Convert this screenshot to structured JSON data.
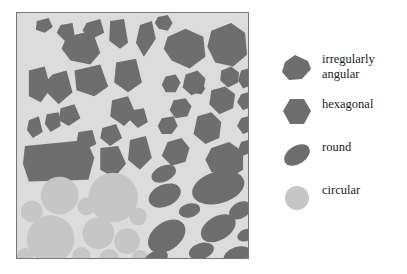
{
  "figure": {
    "panel": {
      "name": "shape-classification-panel",
      "background_color": "#dcdcdc",
      "border_color": "#777777",
      "quadrants": [
        {
          "id": "top-left",
          "class": "irregularly angular",
          "fill": "#6e6e6e",
          "separator": "#ffffff"
        },
        {
          "id": "top-right",
          "class": "hexagonal",
          "fill": "#6e6e6e",
          "separator": "#dcdcdc"
        },
        {
          "id": "bottom-left",
          "class": "circular",
          "fill": "#c6c6c6",
          "separator": "#dcdcdc"
        },
        {
          "id": "bottom-right",
          "class": "round",
          "fill": "#6e6e6e",
          "separator": "#dcdcdc"
        }
      ]
    },
    "legend": {
      "name": "shape-legend",
      "items": [
        {
          "label": "irregularly\nangular",
          "swatch": "irregular-polygon-swatch",
          "color": "#6e6e6e"
        },
        {
          "label": "hexagonal",
          "swatch": "hexagon-swatch",
          "color": "#6e6e6e"
        },
        {
          "label": "round",
          "swatch": "ellipse-swatch",
          "color": "#6e6e6e"
        },
        {
          "label": "circular",
          "swatch": "circle-swatch",
          "color": "#c6c6c6"
        }
      ]
    },
    "colors": {
      "dark_grain": "#6e6e6e",
      "light_grain": "#c6c6c6",
      "matrix_background": "#dcdcdc",
      "grain_separator": "#ffffff",
      "text": "#1a1a1a",
      "panel_border": "#777777"
    }
  }
}
